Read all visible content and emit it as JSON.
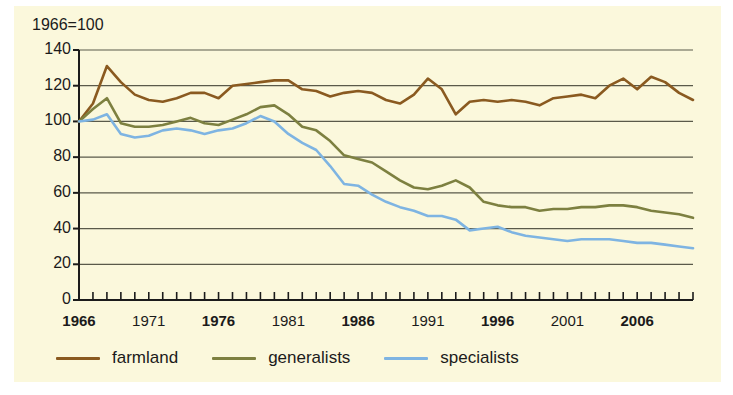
{
  "chart_data": {
    "type": "line",
    "title": "1966=100",
    "xlabel": "",
    "ylabel": "",
    "xlim": [
      1966,
      2010
    ],
    "ylim": [
      0,
      140
    ],
    "ytick_step": 20,
    "grid": "horizontal",
    "legend_position": "bottom-left",
    "background_color": "#fbf8dc",
    "yticks": [
      140,
      120,
      100,
      80,
      60,
      40,
      20,
      0
    ],
    "xticks": [
      1966,
      1971,
      1976,
      1981,
      1986,
      1991,
      1996,
      2001,
      2006
    ],
    "xticks_bold": [
      1966,
      1976,
      1986,
      1996,
      2006
    ],
    "xtick_minor_every": 1,
    "x": [
      1966,
      1967,
      1968,
      1969,
      1970,
      1971,
      1972,
      1973,
      1974,
      1975,
      1976,
      1977,
      1978,
      1979,
      1980,
      1981,
      1982,
      1983,
      1984,
      1985,
      1986,
      1987,
      1988,
      1989,
      1990,
      1991,
      1992,
      1993,
      1994,
      1995,
      1996,
      1997,
      1998,
      1999,
      2000,
      2001,
      2002,
      2003,
      2004,
      2005,
      2006,
      2007,
      2008,
      2009,
      2010
    ],
    "series": [
      {
        "name": "farmland",
        "color": "#8a5a20",
        "values": [
          100,
          110,
          131,
          122,
          115,
          112,
          111,
          113,
          116,
          116,
          113,
          120,
          121,
          122,
          123,
          123,
          118,
          117,
          114,
          116,
          117,
          116,
          112,
          110,
          115,
          124,
          118,
          104,
          111,
          112,
          111,
          112,
          111,
          109,
          113,
          114,
          115,
          113,
          120,
          124,
          118,
          125,
          122,
          116,
          112
        ]
      },
      {
        "name": "generalists",
        "color": "#7d8040",
        "values": [
          100,
          107,
          113,
          99,
          97,
          97,
          98,
          100,
          102,
          99,
          98,
          101,
          104,
          108,
          109,
          104,
          97,
          95,
          89,
          81,
          79,
          77,
          72,
          67,
          63,
          62,
          64,
          67,
          63,
          55,
          53,
          52,
          52,
          50,
          51,
          51,
          52,
          52,
          53,
          53,
          52,
          50,
          49,
          48,
          46
        ]
      },
      {
        "name": "specialists",
        "color": "#7eb4e2",
        "values": [
          100,
          101,
          104,
          93,
          91,
          92,
          95,
          96,
          95,
          93,
          95,
          96,
          99,
          103,
          100,
          93,
          88,
          84,
          75,
          65,
          64,
          59,
          55,
          52,
          50,
          47,
          47,
          45,
          39,
          40,
          41,
          38,
          36,
          35,
          34,
          33,
          34,
          34,
          34,
          33,
          32,
          32,
          31,
          30,
          29
        ]
      }
    ]
  },
  "legend": {
    "items": [
      {
        "label": "farmland",
        "color": "#8a5a20"
      },
      {
        "label": "generalists",
        "color": "#7d8040"
      },
      {
        "label": "specialists",
        "color": "#7eb4e2"
      }
    ]
  }
}
